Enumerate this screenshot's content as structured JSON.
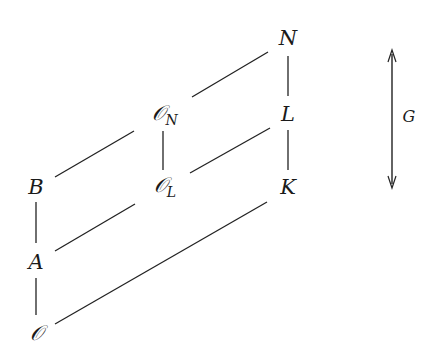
{
  "diagram": {
    "type": "field-extension lattice",
    "nodes": [
      {
        "id": "N",
        "label": "N",
        "sub": "",
        "x": 288,
        "y": 38
      },
      {
        "id": "ON",
        "label": "𝒪",
        "sub": "N",
        "x": 165,
        "y": 115
      },
      {
        "id": "L",
        "label": "L",
        "sub": "",
        "x": 288,
        "y": 114
      },
      {
        "id": "B",
        "label": "B",
        "sub": "",
        "x": 36,
        "y": 187
      },
      {
        "id": "OL",
        "label": "𝒪",
        "sub": "L",
        "x": 165,
        "y": 187
      },
      {
        "id": "K",
        "label": "K",
        "sub": "",
        "x": 288,
        "y": 187
      },
      {
        "id": "A",
        "label": "A",
        "sub": "",
        "x": 36,
        "y": 262
      },
      {
        "id": "O",
        "label": "𝒪",
        "sub": "",
        "x": 36,
        "y": 333
      }
    ],
    "edges": [
      [
        "ON",
        "N"
      ],
      [
        "N",
        "L"
      ],
      [
        "L",
        "K"
      ],
      [
        "B",
        "ON"
      ],
      [
        "ON",
        "OL"
      ],
      [
        "OL",
        "L"
      ],
      [
        "B",
        "A"
      ],
      [
        "A",
        "OL"
      ],
      [
        "A",
        "O"
      ],
      [
        "O",
        "K"
      ]
    ],
    "arrow": {
      "label": "G",
      "x": 392,
      "y1": 52,
      "y2": 185,
      "label_x": 409,
      "label_y": 116,
      "bidirectional": true
    }
  }
}
